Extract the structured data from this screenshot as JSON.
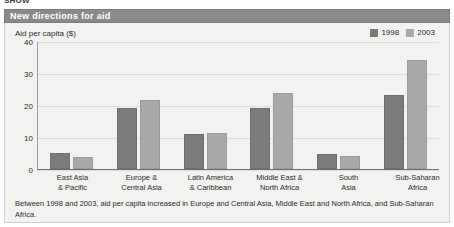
{
  "clipped_top_text": "SHOW",
  "header": {
    "title": "New directions for aid"
  },
  "axis_label": "Aid per capita ($)",
  "legend": [
    {
      "label": "1998",
      "color": "#7b7b7b",
      "icon": "legend-swatch-icon"
    },
    {
      "label": "2003",
      "color": "#a9a9a9",
      "icon": "legend-swatch-icon"
    }
  ],
  "caption": "Between 1998 and 2003, aid per capita increased in Europe and Central Asia, Middle East and North Africa, and Sub-Saharan Africa.",
  "chart_data": {
    "type": "bar",
    "title": "New directions for aid",
    "xlabel": "",
    "ylabel": "Aid per capita ($)",
    "ylim": [
      0,
      40
    ],
    "yticks": [
      0,
      10,
      20,
      30,
      40
    ],
    "grid": true,
    "legend_position": "top-right",
    "categories": [
      "East Asia\n& Pacific",
      "Europe &\nCentral Asia",
      "Latin America\n& Caribbean",
      "Middle East &\nNorth Africa",
      "South\nAsia",
      "Sub-Saharan\nAfrica"
    ],
    "category_lines": [
      [
        "East Asia",
        "& Pacific"
      ],
      [
        "Europe &",
        "Central Asia"
      ],
      [
        "Latin America",
        "& Caribbean"
      ],
      [
        "Middle East &",
        "North Africa"
      ],
      [
        "South",
        "Asia"
      ],
      [
        "Sub-Saharan",
        "Africa"
      ]
    ],
    "series": [
      {
        "name": "1998",
        "color": "#7b7b7b",
        "values": [
          5.0,
          19.0,
          10.8,
          19.2,
          4.6,
          23.2
        ]
      },
      {
        "name": "2003",
        "color": "#a9a9a9",
        "values": [
          3.7,
          21.5,
          11.4,
          23.8,
          4.0,
          34.2
        ]
      }
    ]
  }
}
